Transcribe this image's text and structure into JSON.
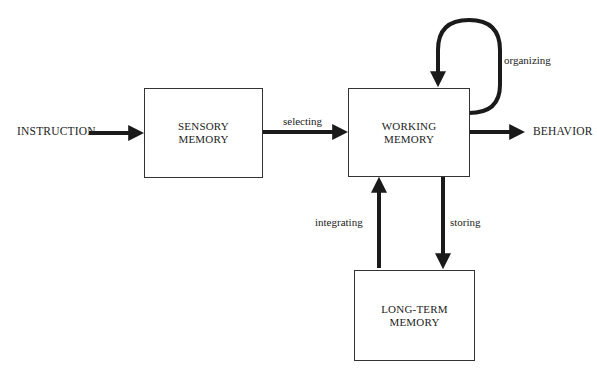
{
  "diagram": {
    "input": "INSTRUCTION",
    "output": "BEHAVIOR",
    "boxes": {
      "sensory": {
        "line1": "SENSORY",
        "line2": "MEMORY"
      },
      "working": {
        "line1": "WORKING",
        "line2": "MEMORY"
      },
      "longterm": {
        "line1": "LONG-TERM",
        "line2": "MEMORY"
      }
    },
    "edges": {
      "selecting": "selecting",
      "organizing": "organizing",
      "integrating": "integrating",
      "storing": "storing"
    },
    "colors": {
      "stroke": "#1a1a1a",
      "box_border": "#333333",
      "background": "#ffffff"
    }
  }
}
